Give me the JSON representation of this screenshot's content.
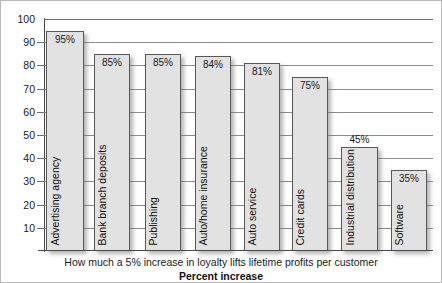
{
  "chart_data": {
    "type": "bar",
    "title": "",
    "caption": "How much a 5% increase in loyalty lifts lifetime profits per customer",
    "xlabel": "Percent increase",
    "ylabel": "",
    "ylim": [
      0,
      100
    ],
    "grid": true,
    "legend": "none",
    "orientation": "vertical",
    "yticks": [
      100,
      90,
      80,
      70,
      60,
      50,
      40,
      30,
      20,
      10
    ],
    "ytick_labels": [
      "100",
      "90",
      "80",
      "70",
      "60",
      "50",
      "40",
      "30",
      "20",
      "10"
    ],
    "categories": [
      "Advertising agency",
      "Bank branch deposits",
      "Publishing",
      "Auto/home insurance",
      "Auto service",
      "Credit cards",
      "Industrial distribution",
      "Software"
    ],
    "values": [
      95,
      85,
      85,
      84,
      81,
      75,
      45,
      35
    ],
    "value_labels": [
      "95%",
      "85%",
      "85%",
      "84%",
      "81%",
      "75%",
      "45%",
      "35%"
    ],
    "value_label_position": [
      "inside",
      "inside",
      "inside",
      "inside",
      "inside",
      "inside",
      "outside",
      "inside"
    ],
    "bar_fill_color": "#e2e2e2",
    "bar_border_color": "#585858",
    "gridline_color": "#8c8c8c",
    "axis_color": "#4a4a4a",
    "text_color": "#111111",
    "bars": [
      {
        "category": "Advertising agency",
        "value": 95,
        "label": "95%",
        "left": 45,
        "width": 38
      },
      {
        "category": "Bank branch deposits",
        "value": 85,
        "label": "85%",
        "left": 93,
        "width": 36
      },
      {
        "category": "Publishing",
        "value": 85,
        "label": "85%",
        "left": 144,
        "width": 36
      },
      {
        "category": "Auto/home insurance",
        "value": 84,
        "label": "84%",
        "left": 194,
        "width": 36
      },
      {
        "category": "Auto service",
        "value": 81,
        "label": "81%",
        "left": 243,
        "width": 36
      },
      {
        "category": "Credit cards",
        "value": 75,
        "label": "75%",
        "left": 291,
        "width": 36
      },
      {
        "category": "Industrial distribution",
        "value": 45,
        "label": "45%",
        "left": 340,
        "width": 37
      },
      {
        "category": "Software",
        "value": 35,
        "label": "35%",
        "left": 390,
        "width": 36
      }
    ]
  }
}
